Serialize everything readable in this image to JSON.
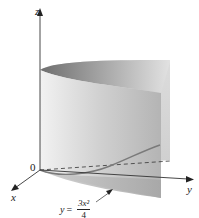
{
  "figure": {
    "type": "3D surface diagram"
  },
  "axes": {
    "z_label": "z",
    "x_label": "x",
    "y_label": "y",
    "origin_label": "0"
  },
  "equation": {
    "lhs": "y",
    "equals": "=",
    "numerator": "3x²",
    "denominator": "4",
    "full_text": "y = 3x²/4"
  },
  "colors": {
    "axis": "#333333",
    "surface_light": "#e6e6e6",
    "surface_mid": "#bdbdbd",
    "surface_dark": "#8a8a8a",
    "curve": "#7a7a7a"
  }
}
